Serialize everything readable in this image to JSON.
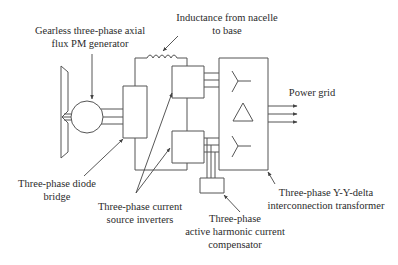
{
  "diagram": {
    "labels": {
      "generator": [
        "Gearless three-phase axial",
        "flux PM generator"
      ],
      "inductance": [
        "Inductance from nacelle",
        "to base"
      ],
      "power_grid": [
        "Power grid"
      ],
      "diode_bridge": [
        "Three-phase diode",
        "bridge"
      ],
      "inverters": [
        "Three-phase current",
        "source inverters"
      ],
      "compensator": [
        "Three-phase",
        "active harmonic current",
        "compensator"
      ],
      "transformer": [
        "Three-phase Y-Y-delta",
        "interconnection transformer"
      ]
    },
    "components": [
      {
        "id": "turbine-rotor",
        "type": "blade"
      },
      {
        "id": "pm-generator",
        "type": "circle"
      },
      {
        "id": "diode-bridge",
        "type": "box"
      },
      {
        "id": "dc-link-inductor",
        "type": "inductor"
      },
      {
        "id": "csi-top",
        "type": "box"
      },
      {
        "id": "csi-bottom",
        "type": "box"
      },
      {
        "id": "compensator",
        "type": "box"
      },
      {
        "id": "transformer",
        "type": "box",
        "windings": [
          "wye",
          "delta",
          "wye"
        ]
      }
    ],
    "colors": {
      "line": "#555555",
      "text": "#2b2b2b",
      "background": "#ffffff"
    }
  }
}
